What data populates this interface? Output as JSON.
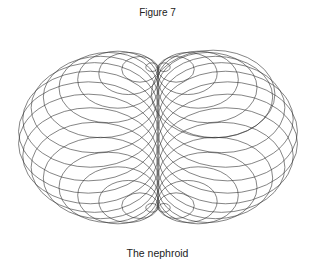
{
  "figure": {
    "title": "Figure 7",
    "caption": "The nephroid"
  },
  "diagram": {
    "type": "nephroid-circle-envelope",
    "center": [
      158,
      137.5
    ],
    "generating_radius_x": 70,
    "generating_radius_y": 70,
    "y_scale": 0.71,
    "circle_count": 36,
    "stroke_color": "#333333",
    "stroke_width": 0.6,
    "extra_circle": {
      "angle_deg": 38,
      "radius_scale": 1.12
    }
  }
}
